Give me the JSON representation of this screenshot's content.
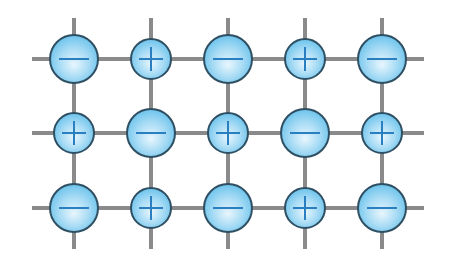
{
  "diagram": {
    "colors": {
      "background": "#ffffff",
      "lattice_line": "#8a8a8a",
      "ion_fill_center": "#e8f6fd",
      "ion_fill_edge": "#6cc3ec",
      "ion_stroke": "#2f4f63",
      "sign": "#2a7fc0"
    },
    "grid": {
      "columns_x": [
        74,
        151,
        228,
        305,
        382
      ],
      "rows_y": [
        59,
        133,
        208
      ],
      "h_line_x": [
        32,
        424
      ],
      "v_line_y": [
        18,
        249
      ]
    },
    "ion_types": {
      "anion": {
        "sign": "−",
        "radius": 24
      },
      "cation": {
        "sign": "+",
        "radius": 20
      }
    },
    "rows": [
      [
        "anion",
        "cation",
        "anion",
        "cation",
        "anion"
      ],
      [
        "cation",
        "anion",
        "cation",
        "anion",
        "cation"
      ],
      [
        "anion",
        "cation",
        "anion",
        "cation",
        "anion"
      ]
    ]
  }
}
